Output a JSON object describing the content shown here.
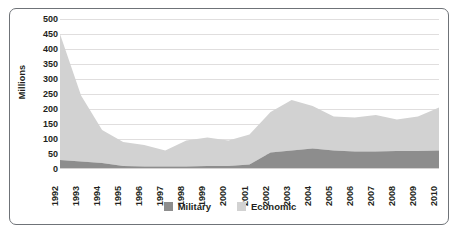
{
  "chart_data": {
    "type": "area",
    "stacked": true,
    "title": "",
    "subtitle": "",
    "xlabel": "",
    "ylabel": "Millions",
    "categories": [
      "1992",
      "1993",
      "1994",
      "1995",
      "1996",
      "1997",
      "1998",
      "1999",
      "2000",
      "2001",
      "2002",
      "2003",
      "2004",
      "2005",
      "2006",
      "2007",
      "2008",
      "2009",
      "2010"
    ],
    "series": [
      {
        "name": "Military",
        "color": "#8d8d8d",
        "values": [
          30,
          25,
          20,
          10,
          8,
          8,
          8,
          10,
          10,
          15,
          55,
          62,
          68,
          62,
          58,
          58,
          60,
          60,
          62
        ]
      },
      {
        "name": "Economic",
        "color": "#d2d2d2",
        "values": [
          420,
          220,
          110,
          80,
          72,
          54,
          87,
          95,
          85,
          100,
          135,
          168,
          142,
          113,
          114,
          122,
          105,
          115,
          143
        ]
      }
    ],
    "totals": [
      450,
      245,
      130,
      90,
      80,
      62,
      95,
      105,
      95,
      115,
      190,
      230,
      210,
      175,
      172,
      180,
      165,
      175,
      205
    ],
    "ylim": [
      0,
      500
    ],
    "ytick_step": 50,
    "yticks": [
      "500",
      "450",
      "400",
      "350",
      "300",
      "250",
      "200",
      "150",
      "100",
      "50",
      "0"
    ],
    "grid": true,
    "legend_position": "bottom"
  },
  "legend": {
    "entries": [
      {
        "label": "Military",
        "color": "#8d8d8d"
      },
      {
        "label": "Economic",
        "color": "#d2d2d2"
      }
    ]
  },
  "colors": {
    "military": "#8d8d8d",
    "economic": "#d2d2d2",
    "gridline": "#e0dede",
    "border": "#6f7378",
    "text": "#231f20",
    "background": "#ffffff"
  }
}
